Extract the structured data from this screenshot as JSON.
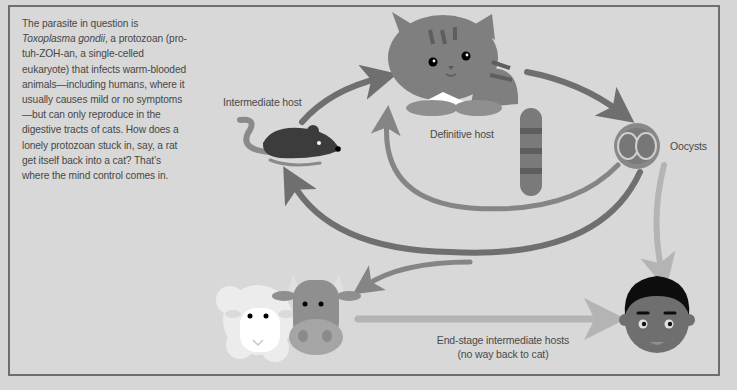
{
  "intro": {
    "line_prefix": "The parasite in question is ",
    "species": "Toxoplasma gondii",
    "body": ", a protozoan (pro-tuh-ZOH-an, a single-celled eukaryote) that infects warm-blooded animals—including humans, where it usually causes mild or no symptoms—but can only reproduce in the digestive tracts of cats. How does a lonely protozoan stuck in, say, a rat get itself back into a cat? That’s where the mind control comes in."
  },
  "labels": {
    "intermediate_host": "Intermediate host",
    "definitive_host": "Definitive host",
    "oocysts": "Oocysts",
    "end_stage_line1": "End-stage intermediate hosts",
    "end_stage_line2": "(no way back to cat)"
  },
  "nodes": [
    {
      "id": "rat",
      "role": "Intermediate host",
      "icon": "rat-icon"
    },
    {
      "id": "cat",
      "role": "Definitive host",
      "icon": "cat-icon"
    },
    {
      "id": "oocysts",
      "role": "Oocysts",
      "icon": "oocyst-icon"
    },
    {
      "id": "sheep-cow",
      "role": "End-stage intermediate hosts",
      "icon": "livestock-icon"
    },
    {
      "id": "human",
      "role": "End-stage intermediate hosts",
      "icon": "human-icon"
    }
  ],
  "edges": [
    {
      "from": "rat",
      "to": "cat"
    },
    {
      "from": "cat",
      "to": "oocysts"
    },
    {
      "from": "oocysts",
      "to": "cat"
    },
    {
      "from": "oocysts",
      "to": "rat"
    },
    {
      "from": "oocysts",
      "to": "sheep-cow"
    },
    {
      "from": "oocysts",
      "to": "human"
    },
    {
      "from": "sheep-cow",
      "to": "human"
    }
  ],
  "colors": {
    "background": "#d8d8d8",
    "frame": "#6e6e6e",
    "arrow_dark": "#6f6f6f",
    "arrow_mid": "#858585",
    "arrow_light": "#b4b4b4",
    "text": "#4a4a4a"
  }
}
